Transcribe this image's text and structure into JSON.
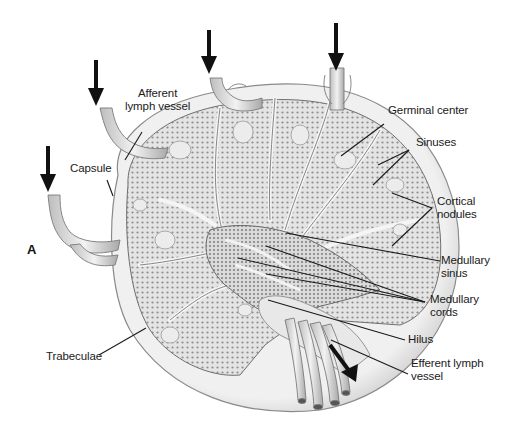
{
  "figure": {
    "panel_letter": "A",
    "colors": {
      "background": "#ffffff",
      "tissue_fill": "#d9d9d9",
      "capsule_fill": "#ececec",
      "outline": "#7a7a7a",
      "arrow": "#111111",
      "leader_line": "#1a1a1a",
      "text": "#1a1a1a"
    }
  },
  "labels": {
    "afferent_lymph_vessel": [
      "Afferent",
      "lymph vessel"
    ],
    "capsule": "Capsule",
    "germinal_center": "Germinal center",
    "sinuses": "Sinuses",
    "cortical_nodules": [
      "Cortical",
      "nodules"
    ],
    "medullary_sinus": [
      "Medullary",
      "sinus"
    ],
    "medullary_cords": [
      "Medullary",
      "cords"
    ],
    "hilus": "Hilus",
    "efferent_lymph_vessel": [
      "Efferent lymph",
      "vessel"
    ],
    "trabeculae": "Trabeculae"
  },
  "arrows": [
    {
      "name": "afferent-arrow-1",
      "direction": "down"
    },
    {
      "name": "afferent-arrow-2",
      "direction": "down"
    },
    {
      "name": "afferent-arrow-3",
      "direction": "down"
    },
    {
      "name": "afferent-arrow-4",
      "direction": "down"
    },
    {
      "name": "efferent-arrow",
      "direction": "down-right"
    }
  ]
}
